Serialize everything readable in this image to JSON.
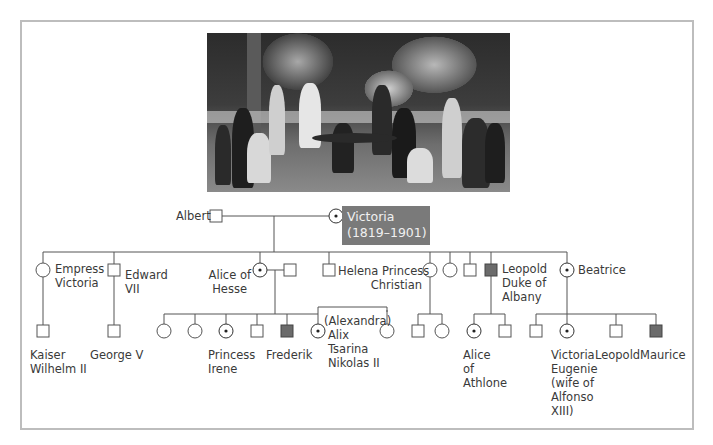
{
  "photo": {
    "description": "Victorian royal family group photograph in a garden",
    "alt": "Queen Victoria with family"
  },
  "colors": {
    "line": "#555555",
    "affected_fill": "#6b6b6b",
    "carrier_dot": "#222222",
    "highlight_box": "#7a7a7a",
    "frame": "#bdbdbd"
  },
  "legend_semantics": {
    "square": "male",
    "circle": "female",
    "filled_square": "affected male (hemophilia)",
    "dotted_circle": "carrier female"
  },
  "founders": {
    "father": {
      "label": "Albert",
      "symbol": "square"
    },
    "mother": {
      "label": "Victoria",
      "dates": "(1819–1901)",
      "symbol": "carrier-circle"
    }
  },
  "generation2": [
    {
      "label": "Empress\nVictoria",
      "l1": "Empress",
      "l2": "Victoria",
      "symbol": "circle"
    },
    {
      "label": "Edward VII",
      "l1": "Edward",
      "l2": "VII",
      "symbol": "square"
    },
    {
      "label": "Alice of Hesse",
      "l1": "Alice of",
      "l2": "Hesse",
      "symbol": "carrier-circle"
    },
    {
      "label": "",
      "symbol": "square",
      "note": "Alice's spouse"
    },
    {
      "label": "",
      "symbol": "square"
    },
    {
      "label": "Helena Princess Christian",
      "l1": "Helena Princess",
      "l2": "Christian",
      "symbol": "circle"
    },
    {
      "label": "",
      "symbol": "circle"
    },
    {
      "label": "",
      "symbol": "square"
    },
    {
      "label": "Leopold Duke of Albany",
      "l1": "Leopold",
      "l2": "Duke of",
      "l3": "Albany",
      "symbol": "affected-square"
    },
    {
      "label": "Beatrice",
      "l1": "Beatrice",
      "symbol": "carrier-circle"
    }
  ],
  "generation3": [
    {
      "parent": "Empress Victoria",
      "label": "Kaiser Wilhelm II",
      "l1": "Kaiser",
      "l2": "Wilhelm II",
      "symbol": "square"
    },
    {
      "parent": "Edward VII",
      "label": "George V",
      "l1": "George V",
      "symbol": "square"
    },
    {
      "parent": "Alice of Hesse",
      "label": "",
      "symbol": "circle"
    },
    {
      "parent": "Alice of Hesse",
      "label": "",
      "symbol": "circle"
    },
    {
      "parent": "Alice of Hesse",
      "label": "Princess Irene",
      "l1": "Princess",
      "l2": "Irene",
      "symbol": "carrier-circle"
    },
    {
      "parent": "Alice of Hesse",
      "label": "",
      "symbol": "square"
    },
    {
      "parent": "Alice of Hesse",
      "label": "Frederik",
      "l1": "Frederik",
      "symbol": "affected-square"
    },
    {
      "parent": "Alice of Hesse",
      "label": "(Alexandra) Alix Tsarina Nikolas II",
      "l0": "(Alexandra)",
      "l1": "Alix",
      "l2": "Tsarina",
      "l3": "Nikolas II",
      "symbol": "carrier-circle"
    },
    {
      "parent": "Alice of Hesse",
      "label": "",
      "symbol": "circle"
    },
    {
      "parent": "Helena",
      "label": "",
      "symbol": "square"
    },
    {
      "parent": "Helena",
      "label": "",
      "symbol": "circle"
    },
    {
      "parent": "Leopold",
      "label": "Alice of Athlone",
      "l1": "Alice",
      "l2": "of",
      "l3": "Athlone",
      "symbol": "carrier-circle"
    },
    {
      "parent": "Leopold",
      "label": "",
      "symbol": "square"
    },
    {
      "parent": "Beatrice",
      "label": "",
      "symbol": "square"
    },
    {
      "parent": "Beatrice",
      "label": "Victoria Eugenie (wife of Alfonso XIII)",
      "l1": "Victoria",
      "l2": "Eugenie",
      "l3": "(wife of",
      "l4": "Alfonso",
      "l5": "XIII)",
      "symbol": "carrier-circle"
    },
    {
      "parent": "Beatrice",
      "label": "Leopold",
      "l1": "Leopold",
      "symbol": "square"
    },
    {
      "parent": "Beatrice",
      "label": "Maurice",
      "l1": "Maurice",
      "symbol": "affected-square"
    }
  ]
}
